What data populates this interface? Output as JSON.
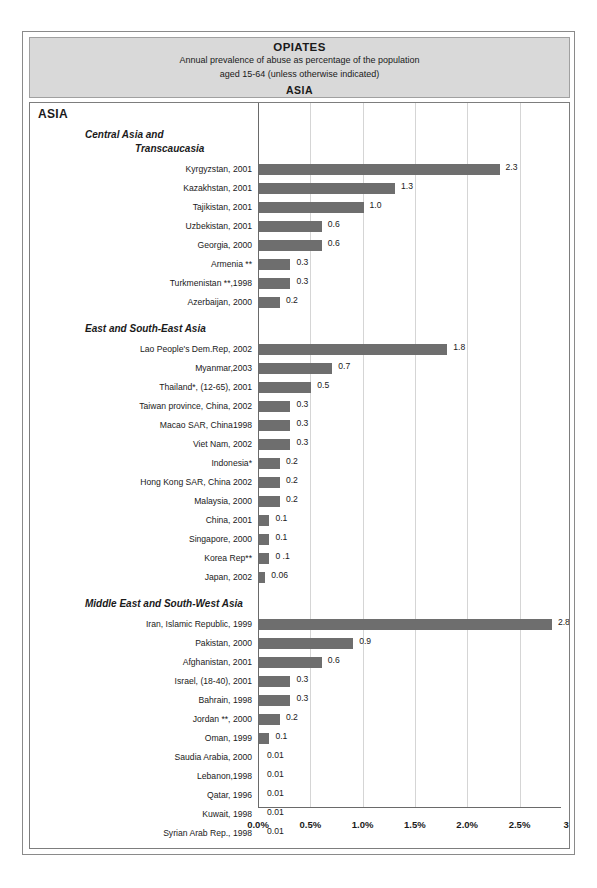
{
  "header": {
    "title": "OPIATES",
    "subtitle_line1": "Annual prevalence of abuse as percentage of the population",
    "subtitle_line2": "aged 15-64 (unless otherwise indicated)",
    "region": "ASIA"
  },
  "continent_label": "ASIA",
  "axis": {
    "ticks": [
      "0.0%",
      "0.5%",
      "1.0%",
      "1.5%",
      "2.0%",
      "2.5%",
      "3 %"
    ],
    "tick_values": [
      0,
      0.5,
      1.0,
      1.5,
      2.0,
      2.5,
      3.0
    ]
  },
  "colors": {
    "bar": "#6e6e6e",
    "header_background": "#d9d9d9",
    "gridline": "#d5d5d5",
    "frame": "#7d7d7d"
  },
  "chart_data": {
    "type": "bar",
    "orientation": "horizontal",
    "title": "OPIATES",
    "subtitle": "Annual prevalence of abuse as percentage of the population aged 15-64 (unless otherwise indicated)",
    "xlabel": "",
    "ylabel": "",
    "xlim": [
      0,
      3.0
    ],
    "grid": true,
    "legend": "none",
    "groups": [
      {
        "name_line1": "Central Asia and",
        "name_line2": "Transcaucasia",
        "categories": [
          "Kyrgyzstan, 2001",
          "Kazakhstan, 2001",
          "Tajikistan, 2001",
          "Uzbekistan, 2001",
          "Georgia, 2000",
          "Armenia **",
          "Turkmenistan **,1998",
          "Azerbaijan, 2000"
        ],
        "values": [
          2.3,
          1.3,
          1.0,
          0.6,
          0.6,
          0.3,
          0.3,
          0.2
        ],
        "labels": [
          "2.3",
          "1.3",
          "1.0",
          "0.6",
          "0.6",
          "0.3",
          "0.3",
          "0.2"
        ]
      },
      {
        "name_line1": "East and South-East Asia",
        "name_line2": "",
        "categories": [
          "Lao People's Dem.Rep, 2002",
          "Myanmar,2003",
          "Thailand*, (12-65), 2001",
          "Taiwan province, China, 2002",
          "Macao SAR, China1998",
          "Viet Nam, 2002",
          "Indonesia*",
          "Hong Kong SAR, China 2002",
          "Malaysia, 2000",
          "China, 2001",
          "Singapore, 2000",
          "Korea Rep**",
          "Japan, 2002"
        ],
        "values": [
          1.8,
          0.7,
          0.5,
          0.3,
          0.3,
          0.3,
          0.2,
          0.2,
          0.2,
          0.1,
          0.1,
          0.1,
          0.06
        ],
        "labels": [
          "1.8",
          "0.7",
          "0.5",
          "0.3",
          "0.3",
          "0.3",
          "0.2",
          "0.2",
          "0.2",
          "0.1",
          "0.1",
          "0 .1",
          "0.06"
        ]
      },
      {
        "name_line1": "Middle East and South-West Asia",
        "name_line2": "",
        "categories": [
          "Iran, Islamic Republic, 1999",
          "Pakistan, 2000",
          "Afghanistan, 2001",
          "Israel, (18-40), 2001",
          "Bahrain, 1998",
          "Jordan **, 2000",
          "Oman, 1999",
          "Saudia Arabia, 2000",
          "Lebanon,1998",
          "Qatar, 1996",
          "Kuwait, 1998",
          "Syrian Arab Rep., 1998"
        ],
        "values": [
          2.8,
          0.9,
          0.6,
          0.3,
          0.3,
          0.2,
          0.1,
          0.01,
          0.01,
          0.01,
          0.01,
          0.01
        ],
        "labels": [
          "2.8",
          "0.9",
          "0.6",
          "0.3",
          "0.3",
          "0.2",
          "0.1",
          "0.01",
          "0.01",
          "0.01",
          "0.01",
          "0.01"
        ]
      },
      {
        "name_line1": "South Asia",
        "name_line2": "",
        "categories": [
          "India, 2001",
          "Nepal, 1996",
          "Sri Lanka, 2000",
          "Bangladesh **",
          "Maldives, 2001**"
        ],
        "values": [
          0.4,
          0.4,
          0.3,
          0.3,
          0.2
        ],
        "labels": [
          "0.4",
          "0.4",
          "0.3",
          "0.3",
          "0.2"
        ]
      }
    ]
  }
}
